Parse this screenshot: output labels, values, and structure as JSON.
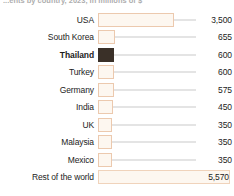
{
  "chart_data": {
    "type": "bar",
    "orientation": "horizontal",
    "title": "...ents by country, 2023, in millions of $",
    "xlabel": "",
    "ylabel": "",
    "grid": false,
    "legend": "none",
    "xlim": [
      0,
      5570
    ],
    "categories": [
      "USA",
      "South Korea",
      "Thailand",
      "Turkey",
      "Germany",
      "India",
      "UK",
      "Malaysia",
      "Mexico",
      "Rest of the world"
    ],
    "values": [
      3500,
      655,
      600,
      600,
      575,
      450,
      350,
      350,
      350,
      5570
    ],
    "value_labels": [
      "3,500",
      "655",
      "600",
      "600",
      "575",
      "450",
      "350",
      "350",
      "350",
      "5,570"
    ],
    "highlighted_category": "Thailand",
    "bar_pixel_widths": [
      76,
      17,
      16,
      16,
      16,
      15,
      14,
      14,
      14,
      132
    ],
    "colors": {
      "bar_fill": "#fdf7f0",
      "bar_border": "#ecc9ae",
      "highlight_fill": "#3a3028",
      "connector_line": "#c9c9c9",
      "text": "#1c1c1c",
      "background": "#ffffff"
    }
  },
  "rows": [
    {
      "label": "USA",
      "value_label": "3,500",
      "bar_px": 76,
      "highlight": false,
      "wide": false
    },
    {
      "label": "South Korea",
      "value_label": "655",
      "bar_px": 17,
      "highlight": false,
      "wide": false
    },
    {
      "label": "Thailand",
      "value_label": "600",
      "bar_px": 16,
      "highlight": true,
      "wide": false
    },
    {
      "label": "Turkey",
      "value_label": "600",
      "bar_px": 16,
      "highlight": false,
      "wide": false
    },
    {
      "label": "Germany",
      "value_label": "575",
      "bar_px": 16,
      "highlight": false,
      "wide": false
    },
    {
      "label": "India",
      "value_label": "450",
      "bar_px": 15,
      "highlight": false,
      "wide": false
    },
    {
      "label": "UK",
      "value_label": "350",
      "bar_px": 14,
      "highlight": false,
      "wide": false
    },
    {
      "label": "Malaysia",
      "value_label": "350",
      "bar_px": 14,
      "highlight": false,
      "wide": false
    },
    {
      "label": "Mexico",
      "value_label": "350",
      "bar_px": 14,
      "highlight": false,
      "wide": false
    },
    {
      "label": "Rest of the world",
      "value_label": "5,570",
      "bar_px": 132,
      "highlight": false,
      "wide": true
    }
  ]
}
